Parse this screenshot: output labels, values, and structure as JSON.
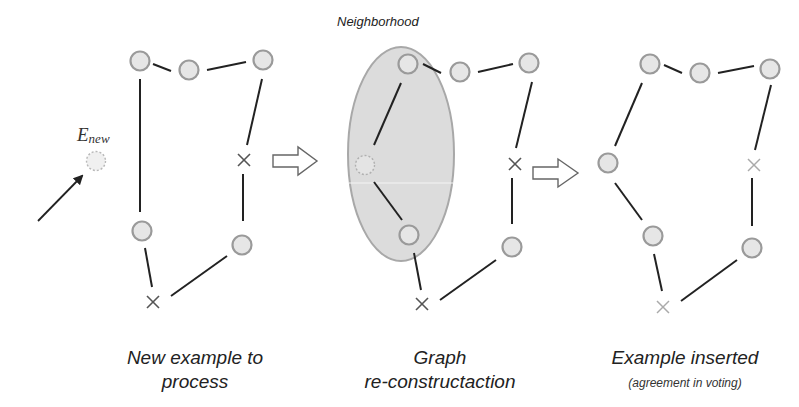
{
  "labels": {
    "neighborhood": "Neighborhood",
    "new_example_symbol": "E",
    "new_example_subscript": "new"
  },
  "panels": [
    {
      "id": "panel-1",
      "caption_line1": "New example to",
      "caption_line2": "process",
      "caption_sub": ""
    },
    {
      "id": "panel-2",
      "caption_line1": "Graph",
      "caption_line2": "re-constructaction",
      "caption_sub": ""
    },
    {
      "id": "panel-3",
      "caption_line1": "Example inserted",
      "caption_line2": "",
      "caption_sub": "(agreement in voting)"
    }
  ],
  "colors": {
    "node_fill": "#e6e6e6",
    "node_stroke": "#9a9a9a",
    "edge": "#222222",
    "ellipse_fill": "#dcdcdc",
    "ellipse_stroke": "#a8a8a8",
    "cross_dark": "#555555",
    "cross_light": "#aaaaaa"
  },
  "legend": {
    "circle": "example node",
    "cross": "removed / disagreeing node",
    "dashed_circle": "new example"
  }
}
